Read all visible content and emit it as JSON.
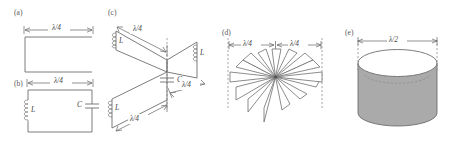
{
  "figure": {
    "title": "",
    "background_color": "#ffffff",
    "line_color": "#6e6e6e",
    "shade_color": "#aaaaaa",
    "panels": [
      {
        "id": "a",
        "label": "(a)",
        "description": "open-ended quarter-wave transmission line",
        "dimension_label": "λ/4",
        "components": []
      },
      {
        "id": "b",
        "label": "(b)",
        "description": "lumped LC resonant loop",
        "dimension_label": "λ/4",
        "components": [
          {
            "symbol": "L",
            "type": "inductor",
            "position": "left"
          },
          {
            "symbol": "C",
            "type": "capacitor",
            "position": "right"
          }
        ]
      },
      {
        "id": "c",
        "label": "(c)",
        "description": "three intersecting quarter-wave planes with shared capacitor",
        "dimension_labels": [
          "λ/4",
          "λ/4",
          "λ/4"
        ],
        "components": [
          {
            "symbol": "L",
            "type": "inductor",
            "position": "upper-left"
          },
          {
            "symbol": "L",
            "type": "inductor",
            "position": "right"
          },
          {
            "symbol": "L",
            "type": "inductor",
            "position": "lower-left"
          },
          {
            "symbol": "C",
            "type": "capacitor",
            "position": "center"
          }
        ]
      },
      {
        "id": "d",
        "label": "(d)",
        "description": "radial array of planes converging at a central axis",
        "dimension_labels": [
          "λ/4",
          "λ/4"
        ],
        "fin_count": 8,
        "components": []
      },
      {
        "id": "e",
        "label": "(e)",
        "description": "cylindrical cavity resonator",
        "dimension_label": "λ/2",
        "components": []
      }
    ]
  }
}
